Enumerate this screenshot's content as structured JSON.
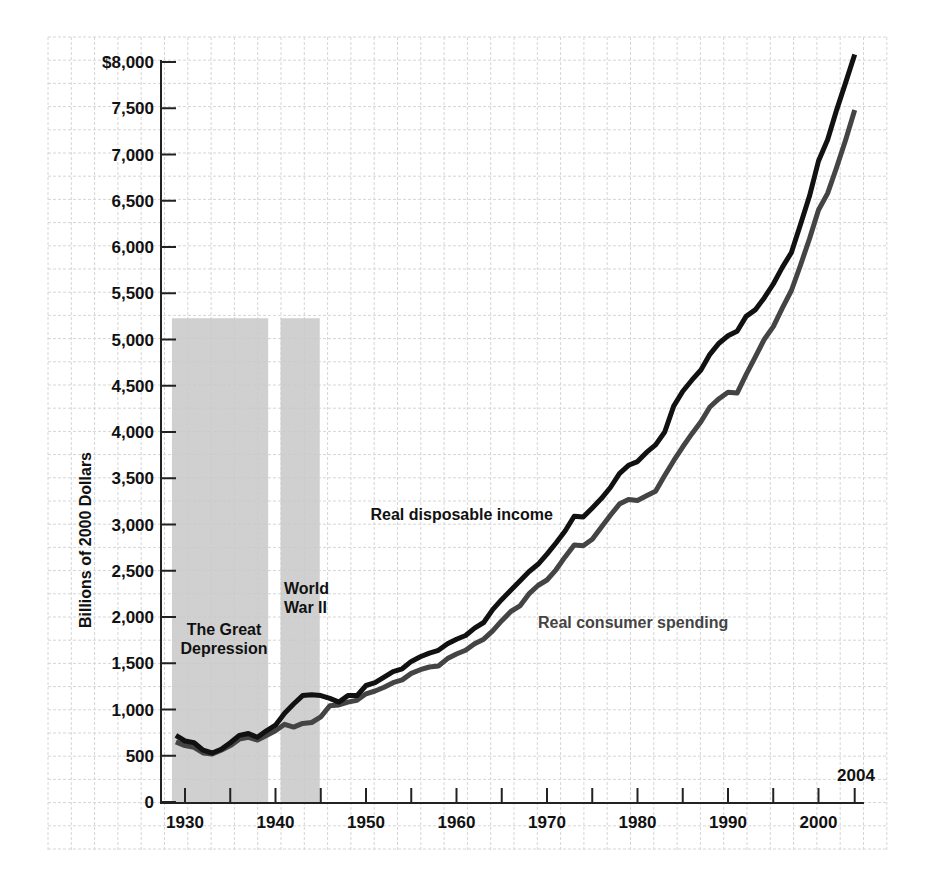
{
  "chart_data": {
    "type": "line",
    "title": "",
    "xlabel": "",
    "ylabel": "Billions of 2000 Dollars",
    "xlim": [
      1928,
      2006
    ],
    "ylim": [
      0,
      8000
    ],
    "grid": true,
    "y_ticks": [
      {
        "value": 0,
        "label": "0"
      },
      {
        "value": 500,
        "label": "500"
      },
      {
        "value": 1000,
        "label": "1,000"
      },
      {
        "value": 1500,
        "label": "1,500"
      },
      {
        "value": 2000,
        "label": "2,000"
      },
      {
        "value": 2500,
        "label": "2,500"
      },
      {
        "value": 3000,
        "label": "3,000"
      },
      {
        "value": 3500,
        "label": "3,500"
      },
      {
        "value": 4000,
        "label": "4,000"
      },
      {
        "value": 4500,
        "label": "4,500"
      },
      {
        "value": 5000,
        "label": "5,000"
      },
      {
        "value": 5500,
        "label": "5,500"
      },
      {
        "value": 6000,
        "label": "6,000"
      },
      {
        "value": 6500,
        "label": "6,500"
      },
      {
        "value": 7000,
        "label": "7,000"
      },
      {
        "value": 7500,
        "label": "7,500"
      },
      {
        "value": 8000,
        "label": "$8,000"
      }
    ],
    "x_ticks": [
      {
        "value": 1930,
        "label": "1930"
      },
      {
        "value": 1935,
        "label": ""
      },
      {
        "value": 1940,
        "label": "1940"
      },
      {
        "value": 1945,
        "label": ""
      },
      {
        "value": 1950,
        "label": "1950"
      },
      {
        "value": 1955,
        "label": ""
      },
      {
        "value": 1960,
        "label": "1960"
      },
      {
        "value": 1965,
        "label": ""
      },
      {
        "value": 1970,
        "label": "1970"
      },
      {
        "value": 1975,
        "label": ""
      },
      {
        "value": 1980,
        "label": "1980"
      },
      {
        "value": 1985,
        "label": ""
      },
      {
        "value": 1990,
        "label": "1990"
      },
      {
        "value": 1995,
        "label": ""
      },
      {
        "value": 2000,
        "label": "2000"
      },
      {
        "value": 2004,
        "label": ""
      }
    ],
    "end_label": "2004",
    "shaded_periods": [
      {
        "label_lines": [
          "The Great",
          "Depression"
        ],
        "start": 1929.0,
        "end": 1939.3
      },
      {
        "label_lines": [
          "World",
          "War II"
        ],
        "start": 1941.0,
        "end": 1945.0
      }
    ],
    "shade_top": 5230,
    "series": [
      {
        "name": "Real disposable income",
        "color": "#111111",
        "label_pos": {
          "x": 1950.5,
          "y": 3050
        },
        "x": [
          1929,
          1930,
          1931,
          1932,
          1933,
          1934,
          1935,
          1936,
          1937,
          1938,
          1939,
          1940,
          1941,
          1942,
          1943,
          1944,
          1945,
          1946,
          1947,
          1948,
          1949,
          1950,
          1951,
          1952,
          1953,
          1954,
          1955,
          1956,
          1957,
          1958,
          1959,
          1960,
          1961,
          1962,
          1963,
          1964,
          1965,
          1966,
          1967,
          1968,
          1969,
          1970,
          1971,
          1972,
          1973,
          1974,
          1975,
          1976,
          1977,
          1978,
          1979,
          1980,
          1981,
          1982,
          1983,
          1984,
          1985,
          1986,
          1987,
          1988,
          1989,
          1990,
          1991,
          1992,
          1993,
          1994,
          1995,
          1996,
          1997,
          1998,
          1999,
          2000,
          2001,
          2002,
          2003,
          2004
        ],
        "values": [
          720,
          660,
          640,
          560,
          530,
          570,
          640,
          720,
          740,
          700,
          770,
          830,
          960,
          1060,
          1150,
          1160,
          1150,
          1120,
          1080,
          1150,
          1150,
          1260,
          1290,
          1350,
          1410,
          1440,
          1520,
          1570,
          1610,
          1640,
          1710,
          1760,
          1800,
          1880,
          1940,
          2080,
          2190,
          2290,
          2390,
          2490,
          2570,
          2680,
          2800,
          2930,
          3090,
          3080,
          3180,
          3280,
          3400,
          3550,
          3640,
          3680,
          3780,
          3860,
          4000,
          4280,
          4440,
          4560,
          4670,
          4840,
          4960,
          5040,
          5090,
          5250,
          5320,
          5450,
          5600,
          5780,
          5940,
          6240,
          6550,
          6930,
          7160,
          7480,
          7780,
          8080
        ]
      },
      {
        "name": "Real consumer spending",
        "color": "#444444",
        "label_pos": {
          "x": 1969.0,
          "y": 1880
        },
        "x": [
          1929,
          1930,
          1931,
          1932,
          1933,
          1934,
          1935,
          1936,
          1937,
          1938,
          1939,
          1940,
          1941,
          1942,
          1943,
          1944,
          1945,
          1946,
          1947,
          1948,
          1949,
          1950,
          1951,
          1952,
          1953,
          1954,
          1955,
          1956,
          1957,
          1958,
          1959,
          1960,
          1961,
          1962,
          1963,
          1964,
          1965,
          1966,
          1967,
          1968,
          1969,
          1970,
          1971,
          1972,
          1973,
          1974,
          1975,
          1976,
          1977,
          1978,
          1979,
          1980,
          1981,
          1982,
          1983,
          1984,
          1985,
          1986,
          1987,
          1988,
          1989,
          1990,
          1991,
          1992,
          1993,
          1994,
          1995,
          1996,
          1997,
          1998,
          1999,
          2000,
          2001,
          2002,
          2003,
          2004
        ],
        "values": [
          650,
          610,
          590,
          530,
          520,
          560,
          610,
          680,
          700,
          670,
          720,
          770,
          840,
          810,
          850,
          860,
          920,
          1040,
          1050,
          1080,
          1100,
          1170,
          1200,
          1240,
          1290,
          1320,
          1390,
          1430,
          1460,
          1470,
          1550,
          1600,
          1640,
          1710,
          1760,
          1850,
          1960,
          2060,
          2120,
          2250,
          2340,
          2400,
          2510,
          2650,
          2780,
          2770,
          2840,
          2970,
          3100,
          3220,
          3270,
          3260,
          3310,
          3360,
          3530,
          3690,
          3840,
          3980,
          4110,
          4270,
          4360,
          4430,
          4420,
          4620,
          4810,
          5000,
          5140,
          5340,
          5530,
          5800,
          6090,
          6400,
          6580,
          6860,
          7160,
          7480
        ]
      }
    ]
  }
}
